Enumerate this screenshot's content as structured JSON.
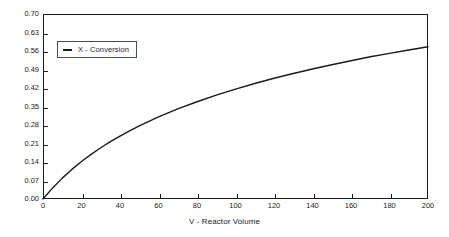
{
  "chart_data": {
    "type": "line",
    "title": "",
    "xlabel": "V - Reactor Volume",
    "ylabel": "",
    "xlim": [
      0,
      200
    ],
    "ylim": [
      0.0,
      0.7
    ],
    "grid": false,
    "legend_position": "top-left",
    "xticks": [
      "0",
      "20",
      "40",
      "60",
      "80",
      "100",
      "120",
      "140",
      "160",
      "180",
      "200"
    ],
    "yticks": [
      "0.00",
      "0.07",
      "0.14",
      "0.21",
      "0.28",
      "0.35",
      "0.42",
      "0.49",
      "0.56",
      "0.63",
      "0.70"
    ],
    "series": [
      {
        "name": "X - Conversion",
        "color": "#1a1a1a",
        "x": [
          0,
          5,
          10,
          15,
          20,
          25,
          30,
          35,
          40,
          45,
          50,
          60,
          70,
          80,
          90,
          100,
          110,
          120,
          130,
          140,
          150,
          160,
          170,
          180,
          190,
          200
        ],
        "values": [
          0.0,
          0.042,
          0.079,
          0.112,
          0.142,
          0.169,
          0.194,
          0.217,
          0.238,
          0.258,
          0.277,
          0.311,
          0.341,
          0.368,
          0.393,
          0.416,
          0.437,
          0.457,
          0.475,
          0.492,
          0.508,
          0.523,
          0.538,
          0.551,
          0.564,
          0.576
        ]
      }
    ]
  },
  "legend": {
    "entries": [
      {
        "label": "X - Conversion",
        "marker": "line-marker"
      }
    ]
  },
  "axes": {
    "x_title": "V - Reactor Volume"
  }
}
